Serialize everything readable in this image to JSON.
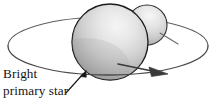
{
  "figure": {
    "kind": "astronomy-diagram",
    "background_color": "#ffffff"
  },
  "caption": {
    "line1": "Bright",
    "line2": "primary star",
    "color": "#141414"
  },
  "objects": {
    "primary_star": {
      "label": "Bright primary star",
      "center_x": 110,
      "center_y": 42,
      "radius": 38,
      "highlight_color": "#f2f2f2",
      "mid_color": "#cfcfcf",
      "shadow_color": "#9c9c9c",
      "outline_color": "#1a1a1a"
    },
    "companion_star": {
      "label": "companion star",
      "center_x": 147,
      "center_y": 25,
      "radius": 20,
      "highlight_color": "#f4f4f4",
      "mid_color": "#d2d2d2",
      "shadow_color": "#a8a8a8",
      "outline_color": "#2a2a2a"
    },
    "orbit": {
      "label": "orbital path ellipse",
      "center_x": 108,
      "center_y": 46,
      "radius_x": 100,
      "radius_y": 29,
      "stroke_color": "#5f5f5f",
      "stroke_width": 1.1
    },
    "direction_arrow": {
      "label": "orbital direction arrow",
      "color": "#3a3a3a",
      "points_toward": "right"
    },
    "caption_pointer": {
      "label": "leader line from caption to primary star",
      "color": "#1a1a1a"
    }
  }
}
